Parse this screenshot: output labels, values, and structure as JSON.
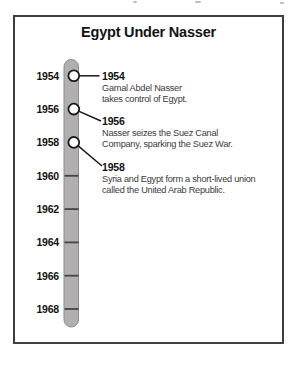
{
  "title": "Egypt Under Nasser",
  "timeline": {
    "years": [
      "1954",
      "1956",
      "1958",
      "1960",
      "1962",
      "1964",
      "1966",
      "1968"
    ],
    "marked_years": [
      "1954",
      "1956",
      "1958"
    ]
  },
  "events": [
    {
      "year": "1954",
      "lines": [
        "Gamal Abdel Nasser",
        "takes control of Egypt."
      ]
    },
    {
      "year": "1956",
      "lines": [
        "Nasser seizes the Suez Canal",
        "Company, sparking the Suez War."
      ]
    },
    {
      "year": "1958",
      "lines": [
        "Syria and Egypt form a short-lived union",
        "called the United Arab Republic."
      ]
    }
  ],
  "colors": {
    "bar_fill": "#b1afaf",
    "bar_edge": "#8e8c8c",
    "tick": "#454545",
    "marker_fill": "#ffffff",
    "marker_stroke": "#1a1a1a",
    "panel_border": "#3f3f3f",
    "heading_text": "#121212",
    "body_text": "#3a3a3a"
  }
}
